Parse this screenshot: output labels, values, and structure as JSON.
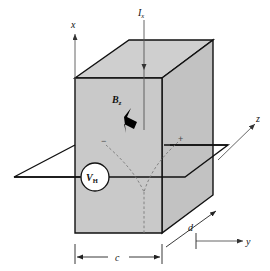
{
  "figure": {
    "background_color": "#ffffff",
    "box_fill_front": "#c9c9c9",
    "box_fill_top": "#cfcfcf",
    "box_fill_side": "#c2c2c2",
    "line_color": "#111111",
    "dashed_color": "#7a7a7a"
  },
  "axes": {
    "x": {
      "label": "x",
      "direction": "up"
    },
    "y": {
      "label": "y",
      "direction": "right"
    },
    "z": {
      "label": "z",
      "direction": "up-right"
    }
  },
  "labels": {
    "current": {
      "symbol": "I",
      "subscript": "x",
      "text": "Ix"
    },
    "field": {
      "symbol": "B",
      "subscript": "z",
      "text": "Bz"
    },
    "voltage": {
      "symbol": "V",
      "subscript": "H",
      "text": "VH"
    }
  },
  "dimensions": {
    "width": {
      "label": "c"
    },
    "depth": {
      "label": "d"
    }
  },
  "charges": {
    "negative": "−",
    "positive": "+"
  }
}
